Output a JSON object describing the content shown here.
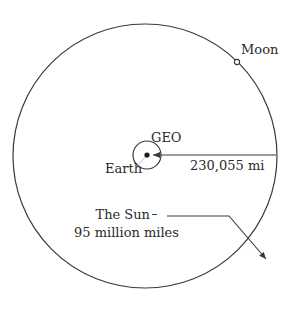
{
  "diagram": {
    "labels": {
      "moon": "Moon",
      "geo": "GEO",
      "earth": "Earth",
      "moon_distance": "230,055 mi",
      "sun": "The Sun",
      "sun_distance": "95 million miles"
    },
    "colors": {
      "stroke": "#3a3a3a",
      "text": "#2a2a2a",
      "background": "#ffffff"
    }
  }
}
